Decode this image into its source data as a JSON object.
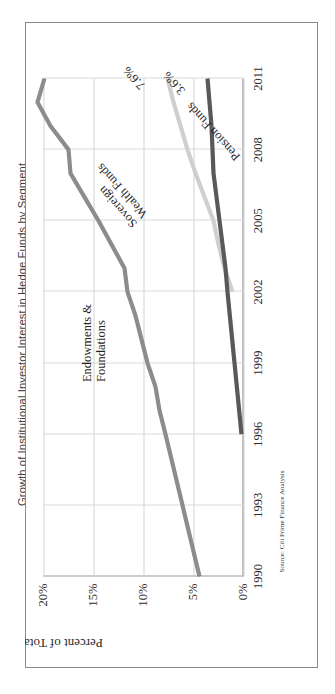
{
  "title": "Growth of Institutional Investor Interest in Hedge Funds by Segment",
  "source_note": "Source: Citi Prime Finance Analysis",
  "axes": {
    "ylabel": "Percent of Total Assets",
    "yticks": [
      "0%",
      "5%",
      "10%",
      "15%",
      "20%"
    ],
    "xticks": [
      "1990",
      "1993",
      "1996",
      "1999",
      "2002",
      "2005",
      "2008",
      "2011"
    ]
  },
  "annotations": {
    "endowments_label_line1": "Endowments &",
    "endowments_label_line2": "Foundations",
    "swf_label_line1": "Sovereign",
    "swf_label_line2": "Wealth Funds",
    "pension_label": "Pension Funds",
    "endowments_value": "19.9%",
    "swf_value": "7.6%",
    "pension_value": "3.6%"
  },
  "colors": {
    "endowments": "#8c8c8c",
    "sovereign_wealth": "#cfcfcf",
    "pension": "#595959",
    "gridline": "#d3d3d3",
    "axis": "#808080",
    "frame": "#8a8a8a",
    "title_text": "#3d3d3d"
  },
  "chart_data": {
    "type": "line",
    "title": "Growth of Institutional Investor Interest in Hedge Funds by Segment",
    "xlabel": "",
    "ylabel": "Percent of Total Assets",
    "xlim": [
      1990,
      2011
    ],
    "ylim": [
      0,
      20
    ],
    "grid": true,
    "legend": "inline-annotations",
    "source": "Source: Citi Prime Finance Analysis",
    "series": [
      {
        "name": "Endowments & Foundations",
        "color": "#8c8c8c",
        "end_label": "19.9%",
        "x": [
          1990,
          1993,
          1996,
          1997,
          1998,
          1999,
          2000,
          2001,
          2002,
          2003,
          2004,
          2005,
          2006,
          2007,
          2008,
          2009,
          2010,
          2011
        ],
        "y": [
          4.4,
          6.1,
          7.8,
          8.4,
          8.8,
          9.6,
          10.2,
          10.8,
          11.6,
          11.9,
          13.2,
          14.5,
          15.9,
          17.3,
          17.5,
          19.3,
          20.6,
          19.9
        ]
      },
      {
        "name": "Sovereign Wealth Funds",
        "color": "#cfcfcf",
        "end_label": "7.6%",
        "x": [
          2002,
          2003,
          2004,
          2005,
          2006,
          2007,
          2008,
          2009,
          2010,
          2011
        ],
        "y": [
          1.1,
          1.9,
          2.5,
          3.0,
          3.9,
          4.8,
          5.6,
          6.3,
          7.0,
          7.6
        ]
      },
      {
        "name": "Pension Funds",
        "color": "#595959",
        "end_label": "3.6%",
        "x": [
          1996,
          1999,
          2002,
          2003,
          2005,
          2006,
          2007,
          2008,
          2009,
          2010,
          2011
        ],
        "y": [
          0.2,
          0.9,
          1.6,
          1.8,
          2.4,
          2.7,
          3.0,
          3.1,
          3.2,
          3.4,
          3.6
        ]
      }
    ]
  }
}
